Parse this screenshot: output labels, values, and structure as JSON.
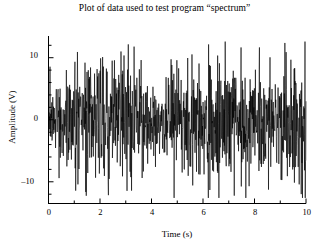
{
  "chart_data": {
    "type": "line",
    "title": "Plot of data used to test program “spectrum”",
    "xlabel": "Time (s)",
    "ylabel": "Amplitude (V)",
    "xlim": [
      0,
      10
    ],
    "ylim": [
      -13.5,
      13.5
    ],
    "grid": false,
    "legend": null,
    "series_name": "test data",
    "line_color": "#000000",
    "background_color": "#ffffff",
    "axis_style": "left-and-bottom-only",
    "x_major_ticks": [
      0,
      2,
      4,
      6,
      8,
      10
    ],
    "x_major_tick_labels": [
      "0",
      "2",
      "4",
      "6",
      "8",
      "10"
    ],
    "x_minor_tick_step": 1,
    "y_major_ticks": [
      10,
      0,
      -10
    ],
    "y_major_tick_labels": [
      "10",
      "0",
      "–10"
    ],
    "y_minor_tick_step": 2,
    "x": [
      0.0,
      0.02,
      0.04,
      0.06,
      0.08,
      0.1,
      0.12,
      0.14,
      0.16,
      0.18,
      0.2,
      0.22,
      0.24,
      0.26,
      0.28,
      0.3,
      0.32,
      0.34,
      0.36,
      0.38,
      0.4,
      0.42,
      0.44,
      0.46,
      0.48,
      0.5,
      0.52,
      0.54,
      0.56,
      0.58,
      0.6,
      0.62,
      0.64,
      0.66,
      0.68,
      0.7,
      0.72,
      0.74,
      0.76,
      0.78,
      0.8,
      0.82,
      0.84,
      0.86,
      0.88,
      0.9,
      0.92,
      0.94,
      0.96,
      0.98,
      1.0
    ],
    "note_on_values": "Waveform is noise; individual sample values are reconstructed procedurally from the seeded generator parameters below rather than enumerated.",
    "generator": {
      "samples": 1024,
      "duration_s": 10,
      "seed": 20250114,
      "base_amplitude": 4.2,
      "spike_probability": 0.2,
      "spike_amplitude": 11.5,
      "envelope_dips_at_s": [
        0.0,
        4.2
      ],
      "envelope_dip_depth": 0.38
    }
  },
  "axes": {
    "y_tick_10": "10",
    "y_tick_0": "0",
    "y_tick_neg10": "–10",
    "x_tick_0": "0",
    "x_tick_2": "2",
    "x_tick_4": "4",
    "x_tick_6": "6",
    "x_tick_8": "8",
    "x_tick_10": "10"
  }
}
